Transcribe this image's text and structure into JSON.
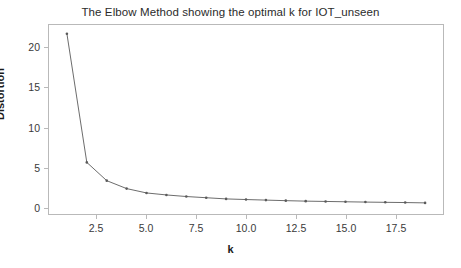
{
  "chart_data": {
    "type": "line",
    "title": "The Elbow Method showing the optimal k for IOT_unseen",
    "xlabel": "k",
    "ylabel": "Distortion",
    "x": [
      1,
      2,
      3,
      4,
      5,
      6,
      7,
      8,
      9,
      10,
      11,
      12,
      13,
      14,
      15,
      16,
      17,
      18,
      19
    ],
    "values": [
      21.8,
      5.6,
      3.3,
      2.3,
      1.75,
      1.5,
      1.3,
      1.15,
      1.0,
      0.92,
      0.85,
      0.78,
      0.72,
      0.68,
      0.64,
      0.6,
      0.57,
      0.54,
      0.5
    ],
    "series": [
      {
        "name": "Distortion",
        "values": [
          21.8,
          5.6,
          3.3,
          2.3,
          1.75,
          1.5,
          1.3,
          1.15,
          1.0,
          0.92,
          0.85,
          0.78,
          0.72,
          0.68,
          0.64,
          0.6,
          0.57,
          0.54,
          0.5
        ]
      }
    ],
    "xlim": [
      0.1,
      19.9
    ],
    "ylim": [
      -0.9,
      22.9
    ],
    "xticks": [
      2.5,
      5.0,
      7.5,
      10.0,
      12.5,
      15.0,
      17.5
    ],
    "xtick_labels": [
      "2.5",
      "5.0",
      "7.5",
      "10.0",
      "12.5",
      "15.0",
      "17.5"
    ],
    "yticks": [
      0,
      5,
      10,
      15,
      20
    ],
    "ytick_labels": [
      "0",
      "5",
      "10",
      "15",
      "20"
    ],
    "grid": false,
    "legend": "none",
    "line_color": "#5a5a5a",
    "marker_color": "#5a5a5a",
    "marker": "point",
    "frame_color": "#b9b9b9",
    "background": "#ffffff"
  }
}
